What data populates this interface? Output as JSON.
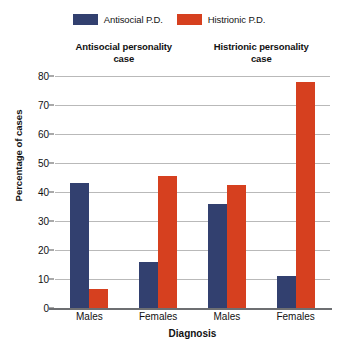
{
  "chart_data": {
    "type": "bar",
    "title": "",
    "xlabel": "Diagnosis",
    "ylabel": "Percentage of cases",
    "ylim": [
      0,
      80
    ],
    "ytick_step": 10,
    "yticks": [
      80,
      70,
      60,
      50,
      40,
      30,
      20,
      10,
      0
    ],
    "grid": true,
    "legend_position": "top-center",
    "categories": [
      "Males",
      "Females",
      "Males",
      "Females"
    ],
    "group_headers": [
      {
        "label_line1": "Antisocial personality",
        "label_line2": "case",
        "spans": 2
      },
      {
        "label_line1": "Histrionic personality",
        "label_line2": "case",
        "spans": 2
      }
    ],
    "series": [
      {
        "name": "Antisocial P.D.",
        "color": "#32406f",
        "values": [
          43,
          16,
          36,
          11
        ]
      },
      {
        "name": "Histrionic P.D.",
        "color": "#d6401f",
        "values": [
          6.5,
          45.5,
          42.5,
          78
        ]
      }
    ]
  },
  "legend": {
    "items": [
      {
        "label": "Antisocial P.D.",
        "color": "#32406f",
        "swatch_name": "legend-swatch-antisocial"
      },
      {
        "label": "Histrionic P.D.",
        "color": "#d6401f",
        "swatch_name": "legend-swatch-histrionic"
      }
    ]
  },
  "axes": {
    "y_title": "Percentage of cases",
    "x_title": "Diagnosis",
    "y_ticks": [
      "80",
      "70",
      "60",
      "50",
      "40",
      "30",
      "20",
      "10",
      "0"
    ],
    "x_ticks": [
      "Males",
      "Females",
      "Males",
      "Females"
    ]
  },
  "group_titles": [
    {
      "line1": "Antisocial personality",
      "line2": "case"
    },
    {
      "line1": "Histrionic personality",
      "line2": "case"
    }
  ],
  "colors": {
    "series_blue": "#32406f",
    "series_orange": "#d6401f",
    "gridline": "#b9b9b9",
    "axis": "#6d6f72",
    "background": "#ffffff"
  }
}
